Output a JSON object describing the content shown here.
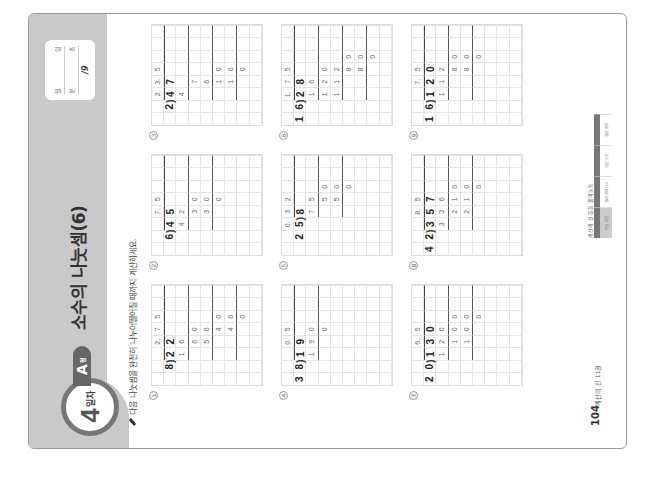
{
  "header": {
    "day_number": "4",
    "day_suffix": "일차",
    "type_letter": "A",
    "type_suffix": "형",
    "title": "소수의 나눗셈(6)"
  },
  "score_box": {
    "date_label_month": "월",
    "date_label_day": "일",
    "time_label_min": "분",
    "time_label_sec": "초",
    "total": "/9"
  },
  "instruction": "다음 나눗셈을 완전히 나누어떨어질 때까지 계산하세요.",
  "problems": [
    {
      "number": "1",
      "dividend": "22",
      "divisor": "8",
      "quotient": "2.75"
    },
    {
      "number": "2",
      "dividend": "45",
      "divisor": "6",
      "quotient": "7.5"
    },
    {
      "number": "3",
      "dividend": "47",
      "divisor": "2",
      "quotient": "23.5"
    },
    {
      "number": "4",
      "dividend": "19",
      "divisor": "38",
      "quotient": "0.5"
    },
    {
      "number": "5",
      "dividend": "8",
      "divisor": "25",
      "quotient": "0.32"
    },
    {
      "number": "6",
      "dividend": "28",
      "divisor": "16",
      "quotient": "1.75"
    },
    {
      "number": "7",
      "dividend": "130",
      "divisor": "20",
      "quotient": "6.5"
    },
    {
      "number": "8",
      "dividend": "357",
      "divisor": "42",
      "quotient": "8.5"
    },
    {
      "number": "9",
      "dividend": "120",
      "divisor": "16",
      "quotient": "7.5"
    }
  ],
  "grids": [
    [
      [
        "",
        "",
        "",
        "2.",
        "7",
        "5",
        "",
        ""
      ],
      [
        "",
        "8",
        "2",
        "2",
        "",
        "",
        "",
        ""
      ],
      [
        "",
        "",
        "1",
        "6",
        "",
        "",
        "",
        ""
      ],
      [
        "",
        "",
        "",
        "6",
        "0",
        "",
        "",
        ""
      ],
      [
        "",
        "",
        "",
        "5",
        "6",
        "",
        "",
        ""
      ],
      [
        "",
        "",
        "",
        "",
        "4",
        "0",
        "",
        ""
      ],
      [
        "",
        "",
        "",
        "",
        "4",
        "0",
        "",
        ""
      ],
      [
        "",
        "",
        "",
        "",
        "",
        "0",
        "",
        ""
      ],
      [
        "",
        "",
        "",
        "",
        "",
        "",
        "",
        ""
      ]
    ],
    [
      [
        "",
        "",
        "",
        "7.",
        "5",
        "",
        "",
        ""
      ],
      [
        "",
        "6",
        "4",
        "5",
        "",
        "",
        "",
        ""
      ],
      [
        "",
        "",
        "4",
        "2",
        "",
        "",
        "",
        ""
      ],
      [
        "",
        "",
        "",
        "3",
        "0",
        "",
        "",
        ""
      ],
      [
        "",
        "",
        "",
        "3",
        "0",
        "",
        "",
        ""
      ],
      [
        "",
        "",
        "",
        "",
        "0",
        "",
        "",
        ""
      ],
      [
        "",
        "",
        "",
        "",
        "",
        "",
        "",
        ""
      ],
      [
        "",
        "",
        "",
        "",
        "",
        "",
        "",
        ""
      ],
      [
        "",
        "",
        "",
        "",
        "",
        "",
        "",
        ""
      ]
    ],
    [
      [
        "",
        "",
        "2",
        "3.",
        "5",
        "",
        "",
        ""
      ],
      [
        "",
        "2",
        "4",
        "7",
        "",
        "",
        "",
        ""
      ],
      [
        "",
        "",
        "4",
        "",
        "",
        "",
        "",
        ""
      ],
      [
        "",
        "",
        "",
        "7",
        "",
        "",
        "",
        ""
      ],
      [
        "",
        "",
        "",
        "6",
        "",
        "",
        "",
        ""
      ],
      [
        "",
        "",
        "",
        "1",
        "0",
        "",
        "",
        ""
      ],
      [
        "",
        "",
        "",
        "1",
        "0",
        "",
        "",
        ""
      ],
      [
        "",
        "",
        "",
        "",
        "0",
        "",
        "",
        ""
      ],
      [
        "",
        "",
        "",
        "",
        "",
        "",
        "",
        ""
      ]
    ],
    [
      [
        "",
        "",
        "",
        "0.",
        "5",
        "",
        "",
        ""
      ],
      [
        "3",
        "8",
        "1",
        "9",
        "",
        "",
        "",
        ""
      ],
      [
        "",
        "",
        "1",
        "9",
        "0",
        "",
        "",
        ""
      ],
      [
        "",
        "",
        "",
        "",
        "0",
        "",
        "",
        ""
      ],
      [
        "",
        "",
        "",
        "",
        "",
        "",
        "",
        ""
      ],
      [
        "",
        "",
        "",
        "",
        "",
        "",
        "",
        ""
      ],
      [
        "",
        "",
        "",
        "",
        "",
        "",
        "",
        ""
      ],
      [
        "",
        "",
        "",
        "",
        "",
        "",
        "",
        ""
      ],
      [
        "",
        "",
        "",
        "",
        "",
        "",
        "",
        ""
      ]
    ],
    [
      [
        "",
        "",
        "0.",
        "3",
        "2",
        "",
        "",
        ""
      ],
      [
        "",
        "2",
        "5",
        "8",
        "",
        "",
        "",
        ""
      ],
      [
        "",
        "",
        "",
        "7",
        "5",
        "",
        "",
        ""
      ],
      [
        "",
        "",
        "",
        "",
        "5",
        "0",
        "",
        ""
      ],
      [
        "",
        "",
        "",
        "",
        "5",
        "0",
        "",
        ""
      ],
      [
        "",
        "",
        "",
        "",
        "",
        "0",
        "",
        ""
      ],
      [
        "",
        "",
        "",
        "",
        "",
        "",
        "",
        ""
      ],
      [
        "",
        "",
        "",
        "",
        "",
        "",
        "",
        ""
      ],
      [
        "",
        "",
        "",
        "",
        "",
        "",
        "",
        ""
      ]
    ],
    [
      [
        "",
        "",
        "1.",
        "7",
        "5",
        "",
        "",
        ""
      ],
      [
        "1",
        "6",
        "2",
        "8",
        "",
        "",
        "",
        ""
      ],
      [
        "",
        "",
        "1",
        "6",
        "",
        "",
        "",
        ""
      ],
      [
        "",
        "",
        "1",
        "2",
        "0",
        "",
        "",
        ""
      ],
      [
        "",
        "",
        "1",
        "1",
        "2",
        "",
        "",
        ""
      ],
      [
        "",
        "",
        "",
        "",
        "8",
        "0",
        "",
        ""
      ],
      [
        "",
        "",
        "",
        "",
        "8",
        "0",
        "",
        ""
      ],
      [
        "",
        "",
        "",
        "",
        "",
        "0",
        "",
        ""
      ],
      [
        "",
        "",
        "",
        "",
        "",
        "",
        "",
        ""
      ]
    ],
    [
      [
        "",
        "",
        "",
        "6.",
        "5",
        "",
        "",
        ""
      ],
      [
        "2",
        "0",
        "1",
        "3",
        "0",
        "",
        "",
        ""
      ],
      [
        "",
        "",
        "1",
        "2",
        "0",
        "",
        "",
        ""
      ],
      [
        "",
        "",
        "",
        "1",
        "0",
        "0",
        "",
        ""
      ],
      [
        "",
        "",
        "",
        "1",
        "0",
        "0",
        "",
        ""
      ],
      [
        "",
        "",
        "",
        "",
        "",
        "0",
        "",
        ""
      ],
      [
        "",
        "",
        "",
        "",
        "",
        "",
        "",
        ""
      ],
      [
        "",
        "",
        "",
        "",
        "",
        "",
        "",
        ""
      ],
      [
        "",
        "",
        "",
        "",
        "",
        "",
        "",
        ""
      ]
    ],
    [
      [
        "",
        "",
        "",
        "8.",
        "5",
        "",
        "",
        ""
      ],
      [
        "4",
        "2",
        "3",
        "5",
        "7",
        "",
        "",
        ""
      ],
      [
        "",
        "",
        "3",
        "3",
        "6",
        "",
        "",
        ""
      ],
      [
        "",
        "",
        "",
        "2",
        "1",
        "0",
        "",
        ""
      ],
      [
        "",
        "",
        "",
        "2",
        "1",
        "0",
        "",
        ""
      ],
      [
        "",
        "",
        "",
        "",
        "",
        "0",
        "",
        ""
      ],
      [
        "",
        "",
        "",
        "",
        "",
        "",
        "",
        ""
      ],
      [
        "",
        "",
        "",
        "",
        "",
        "",
        "",
        ""
      ],
      [
        "",
        "",
        "",
        "",
        "",
        "",
        "",
        ""
      ]
    ],
    [
      [
        "",
        "",
        "",
        "7.",
        "5",
        "",
        "",
        ""
      ],
      [
        "1",
        "6",
        "1",
        "2",
        "0",
        "",
        "",
        ""
      ],
      [
        "",
        "",
        "1",
        "1",
        "2",
        "",
        "",
        ""
      ],
      [
        "",
        "",
        "",
        "",
        "8",
        "0",
        "",
        ""
      ],
      [
        "",
        "",
        "",
        "",
        "8",
        "0",
        "",
        ""
      ],
      [
        "",
        "",
        "",
        "",
        "",
        "0",
        "",
        ""
      ],
      [
        "",
        "",
        "",
        "",
        "",
        "",
        "",
        ""
      ],
      [
        "",
        "",
        "",
        "",
        "",
        "",
        "",
        ""
      ],
      [
        "",
        "",
        "",
        "",
        "",
        "",
        "",
        ""
      ]
    ]
  ],
  "footer": {
    "page_number": "104",
    "book_name": "계산의 신 11권",
    "logo_text": "계산의 신 꼼꼼 풀이노트",
    "table_cells": [
      "학습 방법",
      "틀린 문제 다시",
      "오답 노트",
      "정답 확인"
    ]
  }
}
